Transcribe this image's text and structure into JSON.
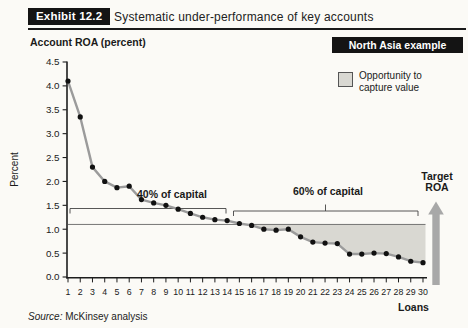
{
  "header": {
    "exhibit_label": "Exhibit 12.2",
    "title": "Systematic under-performance of key accounts"
  },
  "badge": {
    "label": "North Asia example",
    "bg": "#141414",
    "fg": "#ffffff"
  },
  "legend": {
    "line1": "Opportunity to",
    "line2": "capture value",
    "swatch_color": "#d9d8d2"
  },
  "axis_title_left": "Account ROA (percent)",
  "source": {
    "prefix": "Source:",
    "text": "McKinsey analysis"
  },
  "chart_data": {
    "type": "line",
    "title": "Account ROA (percent)",
    "xlabel": "Loans",
    "ylabel": "Percent",
    "x": [
      1,
      2,
      3,
      4,
      5,
      6,
      7,
      8,
      9,
      10,
      11,
      12,
      13,
      14,
      15,
      16,
      17,
      18,
      19,
      20,
      21,
      22,
      23,
      24,
      25,
      26,
      27,
      28,
      29,
      30
    ],
    "values": [
      4.1,
      3.35,
      2.3,
      2.0,
      1.87,
      1.9,
      1.62,
      1.55,
      1.5,
      1.42,
      1.33,
      1.25,
      1.2,
      1.18,
      1.12,
      1.08,
      1.0,
      0.98,
      1.0,
      0.84,
      0.73,
      0.71,
      0.7,
      0.48,
      0.48,
      0.5,
      0.49,
      0.42,
      0.33,
      0.3
    ],
    "y_ticks": [
      "4.5",
      "4.0",
      "3.5",
      "3.0",
      "2.5",
      "2.0",
      "1.5",
      "1.0",
      "0.5",
      "0.0"
    ],
    "ylim": [
      0,
      4.5
    ],
    "grid": "off",
    "series_color": "#9b9b9b",
    "dot_color": "#111111",
    "reference_line": 1.1,
    "shaded_region": {
      "meaning": "Opportunity to capture value",
      "from_loan": 16,
      "to_loan": 30,
      "upper_value": 1.1,
      "color": "#d9d8d2"
    },
    "annotations": [
      {
        "label": "40% of capital",
        "from_loan": 1,
        "to_loan": 14
      },
      {
        "label": "60% of capital",
        "from_loan": 15,
        "to_loan": 30
      }
    ],
    "target": {
      "line1": "Target",
      "line2": "ROA"
    },
    "arrow_color": "#a8a8a8"
  }
}
